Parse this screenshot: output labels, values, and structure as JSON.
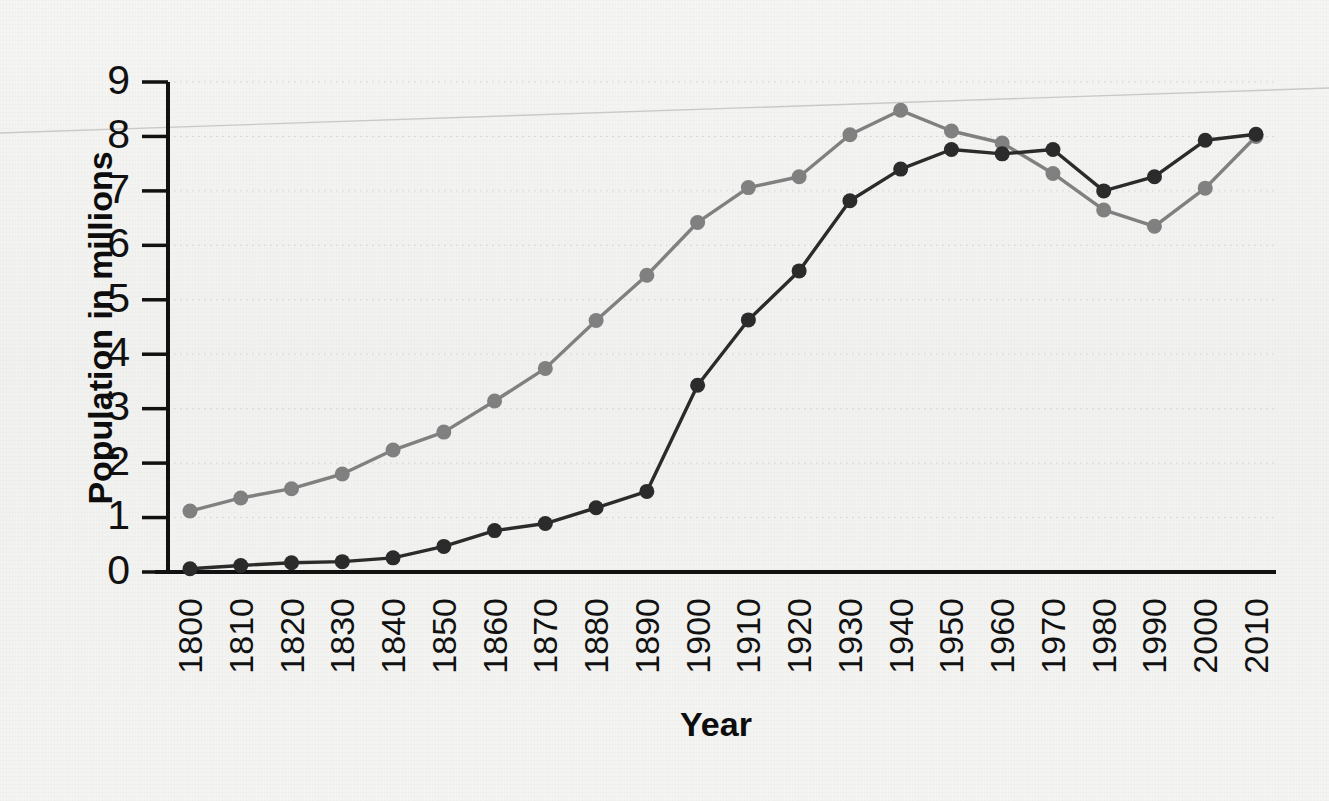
{
  "chart_data": {
    "type": "line",
    "title": "",
    "xlabel": "Year",
    "ylabel": "Population in millions",
    "x": [
      1800,
      1810,
      1820,
      1830,
      1840,
      1850,
      1860,
      1870,
      1880,
      1890,
      1900,
      1910,
      1920,
      1930,
      1940,
      1950,
      1960,
      1970,
      1980,
      1990,
      2000,
      2010
    ],
    "categories": [
      "1800",
      "1810",
      "1820",
      "1830",
      "1840",
      "1850",
      "1860",
      "1870",
      "1880",
      "1890",
      "1900",
      "1910",
      "1920",
      "1930",
      "1940",
      "1950",
      "1960",
      "1970",
      "1980",
      "1990",
      "2000",
      "2010"
    ],
    "series": [
      {
        "name": "gray-series",
        "color": "#808080",
        "values": [
          1.12,
          1.36,
          1.53,
          1.8,
          2.24,
          2.57,
          3.14,
          3.74,
          4.62,
          5.45,
          6.42,
          7.06,
          7.26,
          8.03,
          8.48,
          8.1,
          7.88,
          7.32,
          6.65,
          6.35,
          7.05,
          8.0
        ]
      },
      {
        "name": "dark-series",
        "color": "#2b2b2b",
        "values": [
          0.06,
          0.12,
          0.17,
          0.19,
          0.26,
          0.47,
          0.76,
          0.89,
          1.18,
          1.48,
          3.43,
          4.63,
          5.53,
          6.82,
          7.4,
          7.76,
          7.68,
          7.76,
          7.0,
          7.26,
          7.93,
          8.04
        ]
      }
    ],
    "xlim": [
      1795,
      2015
    ],
    "ylim": [
      0,
      9
    ],
    "y_ticks": [
      0,
      1,
      2,
      3,
      4,
      5,
      6,
      7,
      8,
      9
    ],
    "grid": true,
    "legend": "none",
    "x_tick_rotation": -90
  },
  "axes": {
    "y_title": "Population in millions",
    "x_title": "Year",
    "y_tick_labels": [
      "0",
      "1",
      "2",
      "3",
      "4",
      "5",
      "6",
      "7",
      "8",
      "9"
    ],
    "x_tick_labels": [
      "1800",
      "1810",
      "1820",
      "1830",
      "1840",
      "1850",
      "1860",
      "1870",
      "1880",
      "1890",
      "1900",
      "1910",
      "1920",
      "1930",
      "1940",
      "1950",
      "1960",
      "1970",
      "1980",
      "1990",
      "2000",
      "2010"
    ]
  },
  "colors": {
    "background": "#f3f3f1",
    "axis": "#111111",
    "gridline": "#d9d9d7",
    "series_gray": "#808080",
    "series_dark": "#2b2b2b"
  }
}
